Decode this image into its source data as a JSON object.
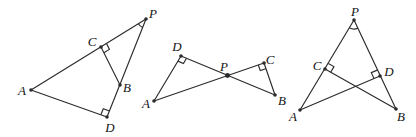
{
  "page": {
    "width": 416,
    "height": 137,
    "background": "#ffffff"
  },
  "figure": {
    "stroke_color": "#2b2b2b",
    "label_color": "#141414",
    "label_font_size": 13,
    "line_width": 1.15,
    "dot_radius": 1.8,
    "diagrams": [
      {
        "id": "left-triangle-figure",
        "description": "triangle A-P-D with C on AP, B on PD, segment CB, right angles at C and D, angle arc at P",
        "points": {
          "A": {
            "label": "A",
            "x": 31,
            "y": 90,
            "lx": 22,
            "ly": 90,
            "dot": true
          },
          "P": {
            "label": "P",
            "x": 146,
            "y": 19,
            "lx": 153,
            "ly": 13,
            "dot": true
          },
          "C": {
            "label": "C",
            "x": 101,
            "y": 47,
            "lx": 92,
            "ly": 41,
            "dot": true
          },
          "B": {
            "label": "B",
            "x": 120,
            "y": 85,
            "lx": 127,
            "ly": 87,
            "dot": true
          },
          "D": {
            "label": "D",
            "x": 107,
            "y": 117,
            "lx": 110,
            "ly": 127,
            "dot": true
          }
        },
        "segments": [
          [
            "A",
            "P"
          ],
          [
            "A",
            "D"
          ],
          [
            "P",
            "D"
          ],
          [
            "C",
            "B"
          ]
        ],
        "right_angle_marks": [
          {
            "vertex": "C",
            "rays": [
              "P",
              "B"
            ],
            "size": 6.5
          },
          {
            "vertex": "D",
            "rays": [
              "A",
              "P"
            ],
            "size": 6.5
          }
        ],
        "angle_arcs": [
          {
            "vertex": "P",
            "rays": [
              "A",
              "D"
            ],
            "radius": 9
          }
        ]
      },
      {
        "id": "bowtie-figure",
        "description": "two triangles ADP and PCB meeting at P; line AC and line DB cross at P; right angles at D and C",
        "points": {
          "A": {
            "label": "A",
            "x": 154,
            "y": 101,
            "lx": 146,
            "ly": 103,
            "dot": true
          },
          "D": {
            "label": "D",
            "x": 181,
            "y": 56,
            "lx": 177,
            "ly": 46,
            "dot": true
          },
          "P": {
            "label": "P",
            "x": 227.5,
            "y": 75.5,
            "lx": 224,
            "ly": 66,
            "dot": true,
            "dot_radius": 2.4
          },
          "C": {
            "label": "C",
            "x": 264,
            "y": 63,
            "lx": 270,
            "ly": 59,
            "dot": true
          },
          "B": {
            "label": "B",
            "x": 275,
            "y": 95,
            "lx": 282,
            "ly": 100,
            "dot": true
          }
        },
        "segments": [
          [
            "A",
            "D"
          ],
          [
            "A",
            "C"
          ],
          [
            "D",
            "B"
          ],
          [
            "C",
            "B"
          ]
        ],
        "right_angle_marks": [
          {
            "vertex": "D",
            "rays": [
              "A",
              "P"
            ],
            "size": 6
          },
          {
            "vertex": "C",
            "rays": [
              "P",
              "B"
            ],
            "size": 6
          }
        ],
        "angle_arcs": []
      },
      {
        "id": "right-triangle-figure",
        "description": "triangle P-A-B with C on PA, D on PB, cevians AD and BC crossing inside, right angles at C and D, angle arc at P",
        "points": {
          "P": {
            "label": "P",
            "x": 354,
            "y": 20,
            "lx": 355,
            "ly": 11,
            "dot": true
          },
          "A": {
            "label": "A",
            "x": 300,
            "y": 110,
            "lx": 293,
            "ly": 116,
            "dot": true
          },
          "B": {
            "label": "B",
            "x": 396,
            "y": 109,
            "lx": 401,
            "ly": 116,
            "dot": true
          },
          "C": {
            "label": "C",
            "x": 325,
            "y": 69,
            "lx": 317,
            "ly": 65,
            "dot": true
          },
          "D": {
            "label": "D",
            "x": 380,
            "y": 76,
            "lx": 389,
            "ly": 71,
            "dot": true
          }
        },
        "segments": [
          [
            "P",
            "A"
          ],
          [
            "P",
            "B"
          ],
          [
            "A",
            "D"
          ],
          [
            "B",
            "C"
          ]
        ],
        "right_angle_marks": [
          {
            "vertex": "C",
            "rays": [
              "P",
              "B"
            ],
            "size": 6.5
          },
          {
            "vertex": "D",
            "rays": [
              "P",
              "A"
            ],
            "size": 6.5
          }
        ],
        "angle_arcs": [
          {
            "vertex": "P",
            "rays": [
              "A",
              "B"
            ],
            "radius": 9
          }
        ]
      }
    ]
  }
}
